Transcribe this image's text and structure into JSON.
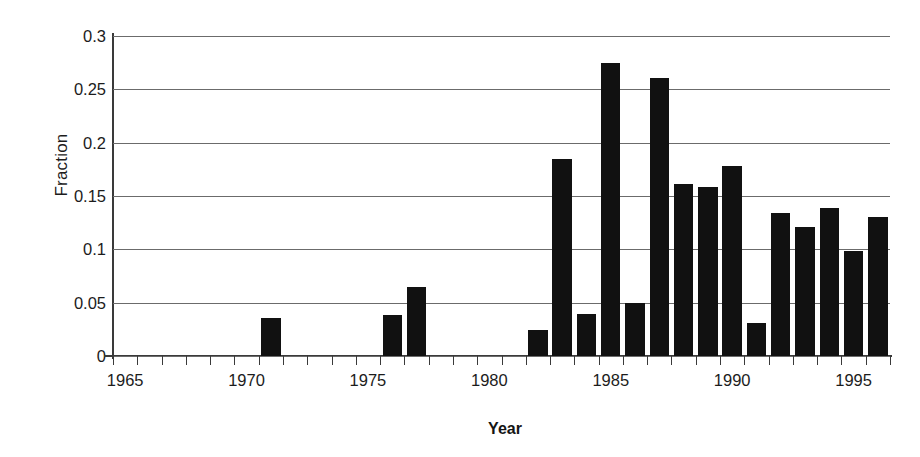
{
  "chart_data": {
    "type": "bar",
    "title": "",
    "xlabel": "Year",
    "ylabel": "Fraction",
    "xlim": [
      1965,
      1996
    ],
    "ylim": [
      0,
      0.3
    ],
    "grid": true,
    "legend": false,
    "y_ticks": [
      "0",
      "0.05",
      "0.1",
      "0.15",
      "0.2",
      "0.25",
      "0.3"
    ],
    "y_tick_values": [
      0,
      0.05,
      0.1,
      0.15,
      0.2,
      0.25,
      0.3
    ],
    "x_ticks": [
      "1965",
      "1970",
      "1975",
      "1980",
      "1985",
      "1990",
      "1995"
    ],
    "x_tick_values": [
      1965,
      1970,
      1975,
      1980,
      1985,
      1990,
      1995
    ],
    "x_minor_tick_values": [
      1965,
      1966,
      1967,
      1968,
      1969,
      1970,
      1971,
      1972,
      1973,
      1974,
      1975,
      1976,
      1977,
      1978,
      1979,
      1980,
      1981,
      1982,
      1983,
      1984,
      1985,
      1986,
      1987,
      1988,
      1989,
      1990,
      1991,
      1992,
      1993,
      1994,
      1995,
      1996
    ],
    "bar_color": "#111111",
    "categories": [
      1965,
      1966,
      1967,
      1968,
      1969,
      1970,
      1971,
      1972,
      1973,
      1974,
      1975,
      1976,
      1977,
      1978,
      1979,
      1980,
      1981,
      1982,
      1983,
      1984,
      1985,
      1986,
      1987,
      1988,
      1989,
      1990,
      1991,
      1992,
      1993,
      1994,
      1995,
      1996
    ],
    "values": [
      0,
      0,
      0,
      0,
      0,
      0,
      0.036,
      0,
      0,
      0,
      0,
      0.038,
      0.065,
      0,
      0,
      0,
      0,
      0.024,
      0.185,
      0.039,
      0.275,
      0.05,
      0.261,
      0.161,
      0.158,
      0.178,
      0.031,
      0.134,
      0.121,
      0.139,
      0.098,
      0.13
    ]
  }
}
